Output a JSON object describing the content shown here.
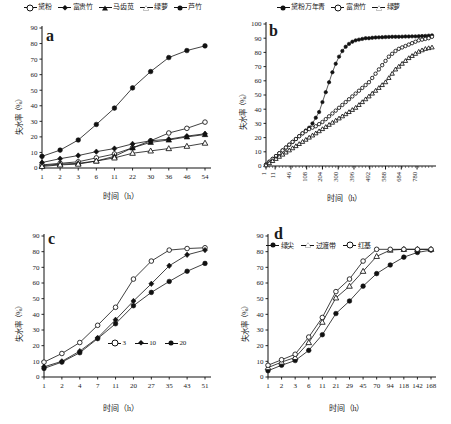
{
  "figure": {
    "axis_x_title": "时间（h）",
    "axis_y_title": "失水率（%）",
    "panels": [
      "a",
      "b",
      "c",
      "d"
    ]
  },
  "panel_a": {
    "letter": "a",
    "legend": [
      {
        "label": "黛粉",
        "marker": "open-circle"
      },
      {
        "label": "富贵竹",
        "marker": "filled-diamond"
      },
      {
        "label": "马齿苋",
        "marker": "filled-triangle"
      },
      {
        "label": "绿萝",
        "marker": "open-triangle"
      },
      {
        "label": "芦竹",
        "marker": "filled-circle"
      }
    ]
  },
  "panel_b": {
    "letter": "b",
    "legend": [
      {
        "label": "黛粉万年青",
        "marker": "filled-circle"
      },
      {
        "label": "富贵竹",
        "marker": "open-circle"
      },
      {
        "label": "绿萝",
        "marker": "open-triangle"
      }
    ]
  },
  "panel_c": {
    "letter": "c",
    "legend": [
      {
        "label": "3",
        "marker": "open-circle"
      },
      {
        "label": "10",
        "marker": "filled-diamond"
      },
      {
        "label": "20",
        "marker": "filled-circle"
      }
    ]
  },
  "panel_d": {
    "letter": "d",
    "legend": [
      {
        "label": "绿尖",
        "marker": "filled-circle"
      },
      {
        "label": "过渡带",
        "marker": "open-triangle"
      },
      {
        "label": "红基",
        "marker": "open-circle"
      }
    ]
  },
  "chart_data": [
    {
      "id": "a",
      "type": "line",
      "title": "a",
      "xlabel": "时间（h）",
      "ylabel": "失水率（%）",
      "categories": [
        "1",
        "2",
        "3",
        "6",
        "11",
        "22",
        "30",
        "36",
        "46",
        "54"
      ],
      "ylim": [
        0,
        90
      ],
      "yticks": [
        0,
        10,
        20,
        30,
        40,
        50,
        60,
        70,
        80,
        90
      ],
      "grid": false,
      "legend_position": "top-center",
      "series": [
        {
          "name": "黛粉",
          "marker": "open-circle",
          "values": [
            2,
            3,
            4,
            6.5,
            9,
            13,
            17.5,
            22.5,
            25.5,
            29.5
          ]
        },
        {
          "name": "富贵竹",
          "marker": "filled-diamond",
          "values": [
            3.5,
            6,
            8,
            10.5,
            12.5,
            15.5,
            17.5,
            18.5,
            20.5,
            22
          ]
        },
        {
          "name": "马齿苋",
          "marker": "filled-triangle",
          "values": [
            1.5,
            2.5,
            3,
            4.5,
            7.5,
            13,
            16.5,
            18,
            20,
            21.5
          ]
        },
        {
          "name": "绿萝",
          "marker": "open-triangle",
          "values": [
            1,
            2,
            2.5,
            4.5,
            6.5,
            9.5,
            11,
            12.5,
            14,
            16
          ]
        },
        {
          "name": "芦竹",
          "marker": "filled-circle",
          "values": [
            7.5,
            11.5,
            18,
            28,
            38.5,
            51.5,
            62,
            71,
            75.5,
            78.5
          ]
        }
      ]
    },
    {
      "id": "b",
      "type": "line",
      "title": "b",
      "xlabel": "时间（h）",
      "ylabel": "失水率（%）",
      "ylim": [
        0,
        100
      ],
      "yticks": [
        0,
        10,
        20,
        30,
        40,
        50,
        60,
        70,
        80,
        90,
        100
      ],
      "xticks": [
        "1",
        "11",
        "46",
        "108",
        "204",
        "300",
        "396",
        "492",
        "588",
        "684",
        "780"
      ],
      "grid": false,
      "legend_position": "top-center",
      "series": [
        {
          "name": "黛粉万年青",
          "marker": "filled-circle",
          "x": [
            0,
            1,
            2,
            3,
            4,
            5,
            6,
            7,
            8,
            9,
            10,
            11,
            12,
            13,
            14,
            15,
            16,
            17,
            18,
            19,
            20,
            21,
            22,
            23,
            24,
            25,
            26,
            27,
            28,
            29,
            30,
            31,
            32,
            33,
            34,
            35,
            36,
            37,
            38,
            39,
            40,
            41,
            42,
            43,
            44,
            45,
            46,
            47,
            48,
            49,
            50
          ],
          "values": [
            1,
            3,
            5,
            7,
            9,
            11,
            13,
            15,
            17,
            19,
            21,
            23,
            25,
            27,
            30,
            34,
            38,
            45,
            52,
            59,
            66,
            72,
            77,
            81,
            84,
            86,
            87.5,
            88.5,
            89,
            89.5,
            90,
            90,
            90.3,
            90.5,
            90.6,
            90.7,
            90.8,
            90.9,
            91,
            91,
            91,
            91.1,
            91.2,
            91.2,
            91.3,
            91.3,
            91.4,
            91.5,
            91.6,
            91.8,
            92
          ]
        },
        {
          "name": "富贵竹",
          "marker": "open-circle",
          "x": [
            0,
            1,
            2,
            3,
            4,
            5,
            6,
            7,
            8,
            9,
            10,
            11,
            12,
            13,
            14,
            15,
            16,
            17,
            18,
            19,
            20,
            21,
            22,
            23,
            24,
            25,
            26,
            27,
            28,
            29,
            30,
            31,
            32,
            33,
            34,
            35,
            36,
            37,
            38,
            39,
            40,
            41,
            42,
            43,
            44,
            45,
            46,
            47,
            48,
            49,
            50
          ],
          "values": [
            1,
            3,
            5,
            7,
            9,
            11,
            13,
            15,
            17,
            19,
            21,
            23,
            24.5,
            26,
            27,
            28,
            29.5,
            31,
            33,
            35,
            37,
            39,
            41,
            43,
            45,
            47,
            49,
            51,
            53,
            55,
            57,
            59,
            62,
            65,
            68,
            71,
            74,
            77,
            79,
            81,
            82.5,
            83.5,
            84.5,
            85.5,
            86.5,
            87.5,
            88.5,
            89,
            89.5,
            90,
            91
          ]
        },
        {
          "name": "绿萝",
          "marker": "open-triangle",
          "x": [
            0,
            1,
            2,
            3,
            4,
            5,
            6,
            7,
            8,
            9,
            10,
            11,
            12,
            13,
            14,
            15,
            16,
            17,
            18,
            19,
            20,
            21,
            22,
            23,
            24,
            25,
            26,
            27,
            28,
            29,
            30,
            31,
            32,
            33,
            34,
            35,
            36,
            37,
            38,
            39,
            40,
            41,
            42,
            43,
            44,
            45,
            46,
            47,
            48,
            49,
            50
          ],
          "values": [
            0.5,
            2,
            3.5,
            5,
            6.5,
            8,
            9.5,
            11,
            12.5,
            14,
            15.5,
            17,
            18.5,
            20,
            21.5,
            23,
            24.5,
            26,
            27.5,
            29,
            30.5,
            32,
            33.5,
            35,
            36.5,
            38,
            39.5,
            41,
            43,
            45,
            47,
            49,
            51,
            53,
            55,
            57,
            59,
            62,
            65,
            68,
            70,
            72,
            74,
            76,
            77.5,
            79,
            80.5,
            81.5,
            82.5,
            83,
            83.5
          ]
        }
      ]
    },
    {
      "id": "c",
      "type": "line",
      "title": "c",
      "xlabel": "时间（h）",
      "ylabel": "失水率（%）",
      "categories": [
        "1",
        "2",
        "4",
        "7",
        "11",
        "20",
        "27",
        "35",
        "43",
        "51"
      ],
      "ylim": [
        0,
        90
      ],
      "yticks": [
        0,
        10,
        20,
        30,
        40,
        50,
        60,
        70,
        80,
        90
      ],
      "grid": false,
      "legend_position": "inside-lower-right",
      "series": [
        {
          "name": "3",
          "marker": "open-circle",
          "values": [
            9.5,
            15,
            22,
            33,
            44.5,
            62.5,
            74,
            81,
            82,
            82.5
          ]
        },
        {
          "name": "10",
          "marker": "filled-diamond",
          "values": [
            6.5,
            10,
            16.5,
            25,
            36.5,
            48.5,
            59.5,
            71,
            78,
            81
          ]
        },
        {
          "name": "20",
          "marker": "filled-circle",
          "values": [
            5.5,
            9.5,
            15.5,
            24.5,
            34,
            45.5,
            54,
            61,
            67.5,
            72.5
          ]
        }
      ]
    },
    {
      "id": "d",
      "type": "line",
      "title": "d",
      "xlabel": "时间（h）",
      "ylabel": "失水率（%）",
      "categories": [
        "1",
        "2",
        "3",
        "6",
        "11",
        "21",
        "29",
        "45",
        "70",
        "94",
        "118",
        "142",
        "168"
      ],
      "ylim": [
        0,
        90
      ],
      "yticks": [
        0,
        10,
        20,
        30,
        40,
        50,
        60,
        70,
        80,
        90
      ],
      "grid": false,
      "legend_position": "top-inside",
      "series": [
        {
          "name": "绿尖",
          "marker": "filled-circle",
          "values": [
            4,
            7.5,
            10.5,
            17,
            27,
            40.5,
            48.5,
            58,
            66,
            71.5,
            76.5,
            79.5,
            81
          ]
        },
        {
          "name": "过渡带",
          "marker": "open-triangle",
          "values": [
            6,
            9.5,
            12.5,
            22,
            35,
            50.5,
            58,
            67.5,
            77,
            81,
            81.5,
            81.5,
            81.5
          ]
        },
        {
          "name": "红基",
          "marker": "open-circle",
          "values": [
            7.5,
            11,
            14.5,
            25.5,
            38,
            54.5,
            62.5,
            74,
            81.5,
            81.5,
            81.5,
            81.5,
            81.5
          ]
        }
      ]
    }
  ]
}
